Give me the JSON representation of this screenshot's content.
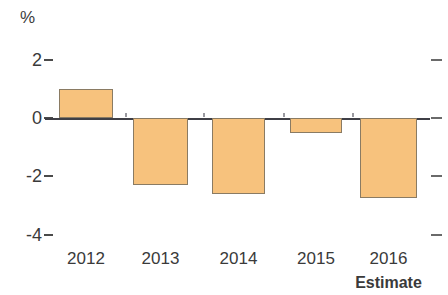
{
  "chart_data": {
    "type": "bar",
    "title": "",
    "subtitle": "",
    "xlabel": "",
    "ylabel": "%",
    "unit": "%",
    "categories": [
      "2012",
      "2013",
      "2014",
      "2015",
      "2016"
    ],
    "values": [
      1.0,
      -2.3,
      -2.6,
      -0.5,
      -2.75
    ],
    "series": [
      {
        "name": "",
        "values": [
          1.0,
          -2.3,
          -2.6,
          -0.5,
          -2.75
        ]
      }
    ],
    "ylim": [
      -4.6,
      2.6
    ],
    "yticks": [
      2,
      0,
      -2,
      -4
    ],
    "ytick_labels": [
      "2",
      "0",
      "-2",
      "-4"
    ],
    "grid": false,
    "legend": null,
    "legend_position": "none",
    "annotations": [
      {
        "text": "Estimate",
        "attached_to_category": "2016"
      }
    ],
    "colors": {
      "bar_fill": "#f7c27d",
      "bar_stroke": "#8a7b63",
      "axis": "#3f3f46",
      "text": "#3a3a3a",
      "background": "#ffffff"
    }
  },
  "axis": {
    "unit_label": "%",
    "y_ticks": [
      {
        "label": "2",
        "value": 2
      },
      {
        "label": "0",
        "value": 0
      },
      {
        "label": "-2",
        "value": -2
      },
      {
        "label": "-4",
        "value": -4
      }
    ]
  },
  "bars": [
    {
      "year": "2012",
      "value": 1.0,
      "sublabel": ""
    },
    {
      "year": "2013",
      "value": -2.3,
      "sublabel": ""
    },
    {
      "year": "2014",
      "value": -2.6,
      "sublabel": ""
    },
    {
      "year": "2015",
      "value": -0.5,
      "sublabel": ""
    },
    {
      "year": "2016",
      "value": -2.75,
      "sublabel": "Estimate"
    }
  ],
  "x_labels": [
    "2012",
    "2013",
    "2014",
    "2015",
    "2016"
  ],
  "estimate_note": "Estimate"
}
